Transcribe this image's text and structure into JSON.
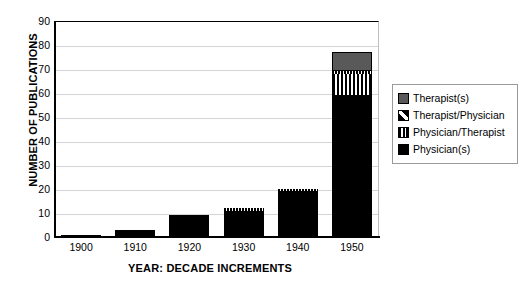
{
  "chart_data": {
    "type": "bar",
    "stacked": true,
    "title": "",
    "xlabel": "YEAR:  DECADE INCREMENTS",
    "ylabel": "NUMBER OF PUBLICATIONS",
    "categories": [
      "1900",
      "1910",
      "1920",
      "1930",
      "1940",
      "1950"
    ],
    "ylim": [
      0,
      90
    ],
    "yticks": [
      "0",
      "10",
      "20",
      "30",
      "40",
      "50",
      "60",
      "70",
      "80",
      "90"
    ],
    "grid": true,
    "legend_position": "right",
    "series": [
      {
        "name": "Physician(s)",
        "pattern": "solid-black",
        "color": "#000000",
        "values": [
          1,
          3,
          9,
          11,
          19,
          59
        ]
      },
      {
        "name": "Physician/Therapist",
        "pattern": "vertical-stripes",
        "color": "#ffffff",
        "values": [
          0,
          0,
          0,
          0,
          0,
          9
        ]
      },
      {
        "name": "Therapist/Physician",
        "pattern": "diagonal-hatch",
        "color": "#000000",
        "values": [
          0,
          0,
          0,
          1,
          1,
          1
        ]
      },
      {
        "name": "Therapist(s)",
        "pattern": "solid-gray",
        "color": "#595959",
        "values": [
          0,
          0,
          0,
          0,
          0,
          8
        ]
      }
    ],
    "totals": [
      1,
      3,
      9,
      12,
      20,
      77
    ]
  },
  "legend": {
    "entries": [
      {
        "label": "Therapist(s)",
        "swatch": "solid-gray-swatch"
      },
      {
        "label": "Therapist/Physician",
        "swatch": "diagonal-hatch-swatch"
      },
      {
        "label": "Physician/Therapist",
        "swatch": "vertical-stripe-swatch"
      },
      {
        "label": "Physician(s)",
        "swatch": "solid-black-swatch"
      }
    ]
  }
}
